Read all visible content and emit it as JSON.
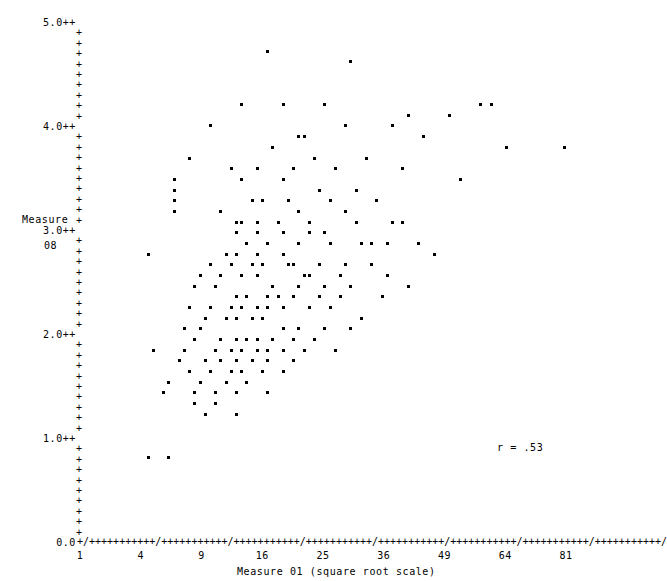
{
  "chart_data": {
    "type": "scatter",
    "title": "",
    "xlabel": "Measure 01 (square root scale)",
    "ylabel": "Measure 08",
    "ylabel_lines": [
      "Measure",
      "08"
    ],
    "xscale": "sqrt",
    "yscale": "linear",
    "xlim": [
      1,
      81
    ],
    "ylim": [
      0.0,
      5.0
    ],
    "grid": false,
    "legend": null,
    "marker": "*",
    "annotations": [
      {
        "text": "r = .53",
        "x": 56,
        "y": 1.05
      }
    ],
    "xticks": [
      1,
      4,
      9,
      16,
      25,
      36,
      49,
      64,
      81
    ],
    "xtick_labels": [
      "1",
      "4",
      "9",
      "16",
      "25",
      "36",
      "49",
      "64",
      "81"
    ],
    "yticks": [
      0.0,
      1.0,
      2.0,
      3.0,
      4.0,
      5.0
    ],
    "ytick_labels": [
      "0.0",
      "1.0++",
      "2.0++",
      "3.0++",
      "4.0++",
      "5.0++"
    ],
    "y_minor_tick_glyph": "+",
    "y_minor_ticks_per_unit": 10,
    "x_axis_glyph_run": "+/+++++++++++/+++++++++++/+++++++++++/+++++++++++/+++++++++++/+++++++++++/+++++++++++/+++++++++++/",
    "n_points": 168,
    "correlation_r": 0.53,
    "points": [
      [
        16.5,
        4.77
      ],
      [
        30.0,
        4.66
      ],
      [
        19.0,
        4.23
      ],
      [
        25.0,
        4.2
      ],
      [
        13.3,
        4.17
      ],
      [
        41.0,
        4.11
      ],
      [
        49.5,
        4.1
      ],
      [
        57.0,
        4.18
      ],
      [
        60.5,
        4.18
      ],
      [
        81.0,
        3.84
      ],
      [
        10.0,
        3.97
      ],
      [
        21.0,
        3.95
      ],
      [
        22.0,
        3.93
      ],
      [
        29.0,
        3.99
      ],
      [
        37.5,
        4.03
      ],
      [
        44.5,
        3.92
      ],
      [
        64.0,
        3.78
      ],
      [
        7.8,
        3.71
      ],
      [
        17.5,
        3.78
      ],
      [
        23.5,
        3.7
      ],
      [
        33.0,
        3.73
      ],
      [
        15.0,
        3.6
      ],
      [
        20.5,
        3.63
      ],
      [
        27.0,
        3.59
      ],
      [
        40.0,
        3.55
      ],
      [
        52.5,
        3.49
      ],
      [
        6.6,
        3.52
      ],
      [
        12.0,
        3.55
      ],
      [
        18.5,
        3.47
      ],
      [
        6.6,
        3.41
      ],
      [
        13.5,
        3.45
      ],
      [
        24.0,
        3.42
      ],
      [
        31.0,
        3.38
      ],
      [
        6.6,
        3.31
      ],
      [
        14.5,
        3.33
      ],
      [
        19.5,
        3.3
      ],
      [
        26.0,
        3.28
      ],
      [
        35.0,
        3.25
      ],
      [
        6.6,
        3.2
      ],
      [
        11.0,
        3.22
      ],
      [
        16.0,
        3.24
      ],
      [
        21.5,
        3.19
      ],
      [
        28.5,
        3.14
      ],
      [
        12.5,
        3.11
      ],
      [
        13.5,
        3.11
      ],
      [
        15.0,
        3.09
      ],
      [
        18.0,
        3.08
      ],
      [
        23.0,
        3.06
      ],
      [
        30.5,
        3.05
      ],
      [
        38.0,
        3.03
      ],
      [
        39.5,
        3.03
      ],
      [
        12.5,
        2.99
      ],
      [
        15.5,
        2.97
      ],
      [
        19.0,
        2.96
      ],
      [
        22.5,
        2.95
      ],
      [
        25.5,
        2.93
      ],
      [
        34.0,
        2.92
      ],
      [
        36.5,
        2.92
      ],
      [
        43.0,
        2.9
      ],
      [
        14.0,
        2.88
      ],
      [
        16.5,
        2.86
      ],
      [
        21.0,
        2.85
      ],
      [
        26.5,
        2.84
      ],
      [
        31.5,
        2.83
      ],
      [
        46.0,
        2.8
      ],
      [
        4.4,
        2.74
      ],
      [
        11.5,
        2.76
      ],
      [
        13.0,
        2.77
      ],
      [
        15.0,
        2.75
      ],
      [
        18.5,
        2.73
      ],
      [
        20.0,
        2.72
      ],
      [
        24.5,
        2.71
      ],
      [
        29.0,
        2.7
      ],
      [
        33.5,
        2.69
      ],
      [
        10.0,
        2.66
      ],
      [
        12.0,
        2.65
      ],
      [
        14.5,
        2.64
      ],
      [
        16.0,
        2.63
      ],
      [
        19.5,
        2.62
      ],
      [
        22.0,
        2.61
      ],
      [
        23.0,
        2.61
      ],
      [
        27.5,
        2.6
      ],
      [
        37.0,
        2.58
      ],
      [
        9.0,
        2.55
      ],
      [
        11.0,
        2.54
      ],
      [
        13.5,
        2.53
      ],
      [
        15.5,
        2.52
      ],
      [
        17.5,
        2.51
      ],
      [
        21.0,
        2.5
      ],
      [
        25.0,
        2.49
      ],
      [
        30.0,
        2.48
      ],
      [
        41.0,
        2.46
      ],
      [
        8.5,
        2.43
      ],
      [
        10.5,
        2.42
      ],
      [
        12.5,
        2.41
      ],
      [
        14.0,
        2.4
      ],
      [
        16.5,
        2.39
      ],
      [
        18.0,
        2.38
      ],
      [
        20.5,
        2.37
      ],
      [
        24.0,
        2.36
      ],
      [
        28.0,
        2.35
      ],
      [
        36.0,
        2.33
      ],
      [
        8.0,
        2.3
      ],
      [
        10.0,
        2.29
      ],
      [
        12.0,
        2.28
      ],
      [
        13.5,
        2.27
      ],
      [
        15.0,
        2.26
      ],
      [
        17.0,
        2.25
      ],
      [
        19.0,
        2.24
      ],
      [
        22.5,
        2.23
      ],
      [
        26.0,
        2.22
      ],
      [
        32.0,
        2.2
      ],
      [
        9.5,
        2.15
      ],
      [
        11.5,
        2.14
      ],
      [
        13.0,
        2.13
      ],
      [
        14.5,
        2.12
      ],
      [
        16.0,
        2.11
      ],
      [
        18.5,
        2.1
      ],
      [
        21.5,
        2.09
      ],
      [
        25.0,
        2.08
      ],
      [
        30.0,
        2.05
      ],
      [
        7.5,
        2.02
      ],
      [
        9.0,
        2.01
      ],
      [
        11.0,
        2.0
      ],
      [
        12.5,
        1.99
      ],
      [
        14.0,
        1.98
      ],
      [
        15.5,
        1.97
      ],
      [
        17.5,
        1.96
      ],
      [
        20.0,
        1.95
      ],
      [
        23.5,
        1.94
      ],
      [
        8.5,
        1.9
      ],
      [
        10.5,
        1.89
      ],
      [
        12.0,
        1.88
      ],
      [
        13.5,
        1.87
      ],
      [
        15.0,
        1.86
      ],
      [
        16.5,
        1.85
      ],
      [
        19.0,
        1.84
      ],
      [
        22.0,
        1.83
      ],
      [
        27.0,
        1.8
      ],
      [
        7.0,
        1.77
      ],
      [
        9.5,
        1.76
      ],
      [
        11.0,
        1.75
      ],
      [
        12.5,
        1.74
      ],
      [
        14.5,
        1.73
      ],
      [
        17.0,
        1.72
      ],
      [
        20.5,
        1.7
      ],
      [
        8.0,
        1.66
      ],
      [
        10.0,
        1.65
      ],
      [
        12.0,
        1.64
      ],
      [
        13.5,
        1.63
      ],
      [
        16.0,
        1.62
      ],
      [
        18.5,
        1.6
      ],
      [
        6.2,
        1.57
      ],
      [
        9.0,
        1.55
      ],
      [
        11.5,
        1.54
      ],
      [
        14.0,
        1.52
      ],
      [
        5.5,
        1.45
      ],
      [
        8.5,
        1.44
      ],
      [
        10.5,
        1.43
      ],
      [
        13.0,
        1.41
      ],
      [
        16.5,
        1.4
      ],
      [
        8.5,
        1.33
      ],
      [
        10.5,
        1.32
      ],
      [
        9.5,
        1.24
      ],
      [
        12.5,
        1.23
      ],
      [
        5.0,
        1.82
      ],
      [
        7.2,
        1.81
      ],
      [
        4.6,
        0.82
      ],
      [
        6.0,
        0.82
      ]
    ]
  },
  "axes": {
    "y": {
      "title_lines": [
        "Measure",
        "08"
      ],
      "major": [
        {
          "label": "5.0++",
          "value": 5.0
        },
        {
          "label": "4.0++",
          "value": 4.0
        },
        {
          "label": "3.0++",
          "value": 3.0
        },
        {
          "label": "2.0++",
          "value": 2.0
        },
        {
          "label": "1.0++",
          "value": 1.0
        },
        {
          "label": "0.0",
          "value": 0.0
        }
      ],
      "minor_glyph": "+"
    },
    "x": {
      "title": "Measure 01 (square root scale)",
      "labels": [
        "1",
        "4",
        "9",
        "16",
        "25",
        "36",
        "49",
        "64",
        "81"
      ],
      "axis_glyphs": "+/+++++++++++/+++++++++++/+++++++++++/+++++++++++/+++++++++++/+++++++++++/+++++++++++/+++++++++++/"
    }
  },
  "stats": {
    "r_label": "r = .53"
  },
  "colors": {
    "background": "#ffffff",
    "foreground": "#000000"
  }
}
